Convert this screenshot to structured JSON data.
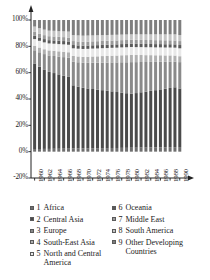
{
  "chart_data": {
    "type": "bar",
    "stacked": true,
    "normalized_percent": true,
    "title": "",
    "subtitle": "",
    "xlabel": "",
    "ylabel": "",
    "ylim": [
      -20,
      100
    ],
    "yticks": [
      -20,
      0,
      20,
      40,
      60,
      80,
      100
    ],
    "ytick_labels": [
      "-20%",
      "0%",
      "20%",
      "40%",
      "60%",
      "80%",
      "100%"
    ],
    "grid": false,
    "legend_position": "bottom",
    "legend_columns": 2,
    "x": [
      1960,
      1961,
      1962,
      1963,
      1964,
      1965,
      1966,
      1967,
      1968,
      1969,
      1970,
      1971,
      1972,
      1973,
      1974,
      1975,
      1976,
      1977,
      1978,
      1979,
      1980,
      1981,
      1982,
      1983,
      1984,
      1985,
      1986,
      1987,
      1988,
      1989,
      1990
    ],
    "categories": [
      "1960",
      "1961",
      "1962",
      "1963",
      "1964",
      "1965",
      "1966",
      "1967",
      "1968",
      "1969",
      "1970",
      "1971",
      "1972",
      "1973",
      "1974",
      "1975",
      "1976",
      "1977",
      "1978",
      "1979",
      "1980",
      "1981",
      "1982",
      "1983",
      "1984",
      "1985",
      "1986",
      "1987",
      "1988",
      "1989",
      "1990"
    ],
    "xtick_labels": [
      "1960",
      "1962",
      "1964",
      "1966",
      "1968",
      "1970",
      "1972",
      "1974",
      "1976",
      "1978",
      "1980",
      "1982",
      "1984",
      "1986",
      "1988",
      "1990"
    ],
    "xtick_step": 2,
    "series": [
      {
        "name": "Africa",
        "number": "1",
        "color": "#6e6e6e",
        "values": [
          2.0,
          2.0,
          2.1,
          2.1,
          2.2,
          2.2,
          2.3,
          2.3,
          2.4,
          2.4,
          2.5,
          2.5,
          2.6,
          2.6,
          2.7,
          2.7,
          2.8,
          2.8,
          2.9,
          2.9,
          3.0,
          3.0,
          3.1,
          3.1,
          3.2,
          3.2,
          3.3,
          3.3,
          3.4,
          3.4,
          3.5
        ]
      },
      {
        "name": "Central Asia",
        "number": "2",
        "color": "#4a4a4a",
        "values": [
          65.0,
          62.5,
          60.0,
          58.5,
          57.5,
          56.5,
          55.5,
          54.5,
          48.0,
          47.0,
          46.0,
          45.5,
          45.0,
          44.5,
          44.0,
          43.5,
          43.0,
          42.5,
          42.0,
          41.5,
          41.0,
          41.5,
          42.0,
          42.5,
          43.0,
          43.5,
          44.0,
          44.5,
          45.0,
          45.5,
          44.5
        ]
      },
      {
        "name": "Europe",
        "number": "3",
        "color": "#8a8a8a",
        "values": [
          10.0,
          11.0,
          12.0,
          12.5,
          13.0,
          13.5,
          14.0,
          14.5,
          18.0,
          18.5,
          19.0,
          19.5,
          20.0,
          20.5,
          21.0,
          21.5,
          22.0,
          22.5,
          23.0,
          23.5,
          24.0,
          23.5,
          23.0,
          22.5,
          22.0,
          21.5,
          21.0,
          20.5,
          20.0,
          19.5,
          20.0
        ]
      },
      {
        "name": "South-East Asia",
        "number": "4",
        "color": "#b0b0b0",
        "values": [
          3.5,
          3.6,
          3.7,
          3.8,
          3.9,
          4.0,
          4.1,
          4.2,
          4.3,
          4.4,
          4.5,
          4.6,
          4.7,
          4.8,
          4.9,
          5.0,
          5.1,
          5.2,
          5.3,
          5.4,
          5.5,
          5.4,
          5.3,
          5.2,
          5.1,
          5.0,
          4.9,
          4.8,
          4.7,
          4.6,
          4.5
        ]
      },
      {
        "name": "North and Central America",
        "number": "5",
        "color": "#e8e8e8",
        "values": [
          5.0,
          5.1,
          5.2,
          5.3,
          5.4,
          5.5,
          5.6,
          5.7,
          5.8,
          5.9,
          6.0,
          6.0,
          6.0,
          6.0,
          6.0,
          6.0,
          6.0,
          6.0,
          6.0,
          6.0,
          6.0,
          6.0,
          6.0,
          6.0,
          6.0,
          6.0,
          6.0,
          6.0,
          6.0,
          6.0,
          6.0
        ]
      },
      {
        "name": "Oceania",
        "number": "6",
        "color": "#5a5a5a",
        "values": [
          2.5,
          2.5,
          2.5,
          2.5,
          2.5,
          2.5,
          2.5,
          2.5,
          2.5,
          2.5,
          2.5,
          2.5,
          2.5,
          2.5,
          2.5,
          2.5,
          2.5,
          2.5,
          2.5,
          2.5,
          2.5,
          2.5,
          2.5,
          2.5,
          2.5,
          2.5,
          2.5,
          2.5,
          2.5,
          2.5,
          2.5
        ]
      },
      {
        "name": "Middle East",
        "number": "7",
        "color": "#9a9a9a",
        "values": [
          3.0,
          3.0,
          3.0,
          3.0,
          3.0,
          3.0,
          3.0,
          3.0,
          3.0,
          3.0,
          3.0,
          3.0,
          3.0,
          3.0,
          3.0,
          3.0,
          3.0,
          3.0,
          3.0,
          3.0,
          3.0,
          3.0,
          3.0,
          3.0,
          3.0,
          3.0,
          3.0,
          3.0,
          3.0,
          3.0,
          3.0
        ]
      },
      {
        "name": "South America",
        "number": "8",
        "color": "#c4c4c4",
        "values": [
          4.0,
          4.1,
          4.2,
          4.2,
          4.3,
          4.3,
          4.4,
          4.5,
          4.5,
          4.6,
          4.6,
          4.6,
          4.5,
          4.5,
          4.4,
          4.4,
          4.3,
          4.3,
          4.2,
          4.2,
          4.1,
          4.2,
          4.2,
          4.3,
          4.3,
          4.4,
          4.4,
          4.5,
          4.5,
          4.6,
          4.6
        ]
      },
      {
        "name": "Other Developing Countries",
        "number": "9",
        "color": "#7e7e7e",
        "values": [
          5.0,
          6.2,
          7.3,
          8.1,
          8.2,
          8.5,
          8.6,
          8.8,
          11.5,
          11.7,
          11.9,
          11.8,
          11.7,
          11.6,
          11.5,
          11.4,
          11.3,
          11.2,
          11.1,
          11.0,
          10.9,
          10.9,
          10.9,
          10.9,
          10.9,
          10.9,
          10.9,
          10.9,
          10.9,
          10.9,
          11.4
        ]
      }
    ]
  },
  "legend": {
    "column_a": [
      {
        "number": "1",
        "label": "Africa"
      },
      {
        "number": "2",
        "label": "Central Asia"
      },
      {
        "number": "3",
        "label": "Europe"
      },
      {
        "number": "4",
        "label": "South-East Asia"
      },
      {
        "number": "5",
        "label": "North and Central America"
      }
    ],
    "column_b": [
      {
        "number": "6",
        "label": "Oceania"
      },
      {
        "number": "7",
        "label": "Middle East"
      },
      {
        "number": "8",
        "label": "South America"
      },
      {
        "number": "9",
        "label": "Other Developing Countries"
      }
    ]
  },
  "axes": {
    "y_arrow": true,
    "x_arrow": true,
    "axis_color": "#222222"
  }
}
